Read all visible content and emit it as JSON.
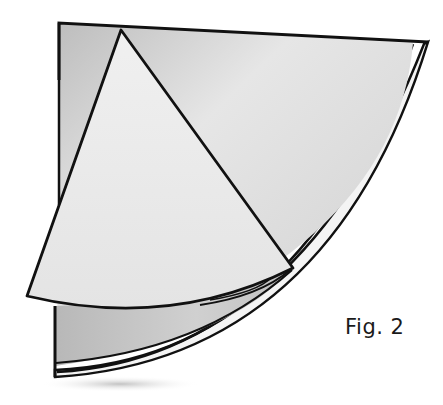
{
  "figure": {
    "caption": "Fig. 2",
    "colors": {
      "outline": "#111111",
      "paper_light": "#ececec",
      "paper_mid": "#cfcfcf",
      "paper_shadow": "#a8a8a8",
      "background": "#ffffff"
    }
  }
}
